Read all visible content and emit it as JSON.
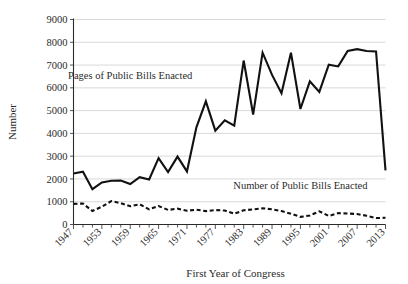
{
  "chart_data": {
    "type": "line",
    "title": "",
    "xlabel": "First Year of Congress",
    "ylabel": "Number",
    "ylim": [
      0,
      9000
    ],
    "ytick_step": 1000,
    "yticks": [
      "0",
      "1000",
      "2000",
      "3000",
      "4000",
      "5000",
      "6000",
      "7000",
      "8000",
      "9000"
    ],
    "xlim": [
      1947,
      2013
    ],
    "xtick_step": 6,
    "xticks": [
      "1947",
      "1953",
      "1959",
      "1965",
      "1971",
      "1977",
      "1983",
      "1989",
      "1995",
      "2001",
      "2007",
      "2013"
    ],
    "minor_xtick_step": 2,
    "grid": "horizontal",
    "legend": "inline-annotations",
    "x": [
      1947,
      1949,
      1951,
      1953,
      1955,
      1957,
      1959,
      1961,
      1963,
      1965,
      1967,
      1969,
      1971,
      1973,
      1975,
      1977,
      1979,
      1981,
      1983,
      1985,
      1987,
      1989,
      1991,
      1993,
      1995,
      1997,
      1999,
      2001,
      2003,
      2005,
      2007,
      2009,
      2011,
      2013
    ],
    "series": [
      {
        "name": "Pages of Public Bills Enacted",
        "style": "solid",
        "label_x": 1959,
        "label_y": 6400,
        "values": [
          2236,
          2314,
          1553,
          1848,
          1918,
          1928,
          1774,
          2078,
          1975,
          2912,
          2304,
          2982,
          2330,
          4264,
          5407,
          4121,
          4576,
          4343,
          7198,
          4827,
          7542,
          6568,
          5767,
          7544,
          5072,
          6283,
          5823,
          7016,
          6940,
          7616,
          7700,
          7617,
          7600,
          2377
        ]
      },
      {
        "name": "Number of Public Bills Enacted",
        "style": "dotted",
        "label_x": 1995,
        "label_y": 1560,
        "values": [
          906,
          921,
          594,
          781,
          1028,
          936,
          800,
          885,
          666,
          810,
          640,
          695,
          607,
          649,
          588,
          633,
          613,
          473,
          623,
          664,
          713,
          665,
          590,
          473,
          333,
          394,
          580,
          377,
          498,
          482,
          460,
          383,
          283,
          296
        ]
      }
    ]
  }
}
